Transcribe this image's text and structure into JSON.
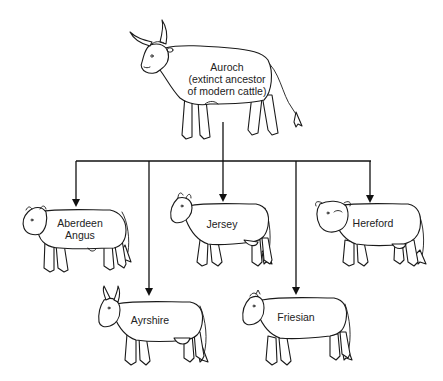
{
  "diagram": {
    "type": "tree",
    "root": {
      "name": "Auroch",
      "label_lines": [
        "Auroch",
        "(extinct ancestor",
        "of modern cattle)"
      ]
    },
    "children": [
      {
        "name": "Aberdeen Angus",
        "label_lines": [
          "Aberdeen",
          "Angus"
        ],
        "row": "upper"
      },
      {
        "name": "Ayrshire",
        "label_lines": [
          "Ayrshire"
        ],
        "row": "lower"
      },
      {
        "name": "Jersey",
        "label_lines": [
          "Jersey"
        ],
        "row": "upper"
      },
      {
        "name": "Friesian",
        "label_lines": [
          "Friesian"
        ],
        "row": "lower"
      },
      {
        "name": "Hereford",
        "label_lines": [
          "Hereford"
        ],
        "row": "upper"
      }
    ],
    "colors": {
      "background": "#ffffff",
      "line": "#111111",
      "text": "#222222"
    }
  }
}
